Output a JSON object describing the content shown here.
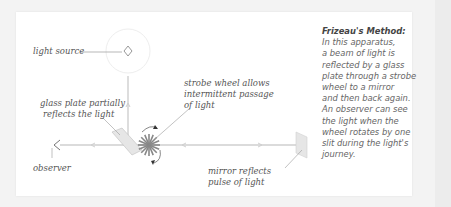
{
  "labels": {
    "light_source": "light source",
    "strobe_wheel": [
      "strobe wheel allows",
      "intermittent passage",
      "of  light"
    ],
    "glass_plate": [
      "glass plate partially",
      "reflects the light"
    ],
    "observer": "observer",
    "mirror": [
      "mirror reflects",
      "pulse of  light"
    ]
  },
  "description": {
    "title": "Frizeau's Method:",
    "lines": [
      "In this apparatus,",
      "a beam of light is",
      "reflected by a glass",
      "plate through a strobe",
      "wheel to a mirror",
      "and then back again.",
      "An observer can see",
      "the light when the",
      "wheel rotates by one",
      "slit during the light's",
      "journey."
    ]
  },
  "colors": {
    "beam": "#cfcfcf",
    "wheel": "#888888",
    "text": "#555555"
  }
}
